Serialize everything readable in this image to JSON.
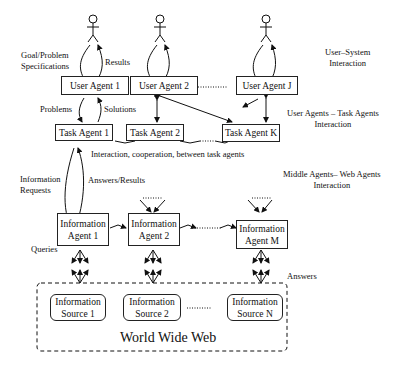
{
  "user_agents": [
    "User Agent 1",
    "User Agent 2",
    "User Agent J"
  ],
  "task_agents": [
    "Task Agent 1",
    "Task Agent 2",
    "Task Agent K"
  ],
  "info_agents": [
    [
      "Information",
      "Agent 1"
    ],
    [
      "Information",
      "Agent 2"
    ],
    [
      "Information",
      "Agent M"
    ]
  ],
  "info_sources": [
    [
      "Information",
      "Source 1"
    ],
    [
      "Information",
      "Source 2"
    ],
    [
      "Information",
      "Source N"
    ]
  ],
  "labels": {
    "goal": [
      "Goal/Problem",
      "Specifications"
    ],
    "results": "Results",
    "problems": "Problems",
    "solutions": "Solutions",
    "task_interaction": "Interaction, cooperation, between task agents",
    "info_requests": [
      "Information",
      "Requests"
    ],
    "answers_results": "Answers/Results",
    "queries": "Queries",
    "answers": "Answers",
    "www": "World Wide Web"
  },
  "layers": {
    "user_system": [
      "User–System",
      "Interaction"
    ],
    "user_task": [
      "User Agents – Task Agents",
      "Interaction"
    ],
    "middle_web": [
      "Middle Agents– Web Agents",
      "Interaction"
    ]
  }
}
